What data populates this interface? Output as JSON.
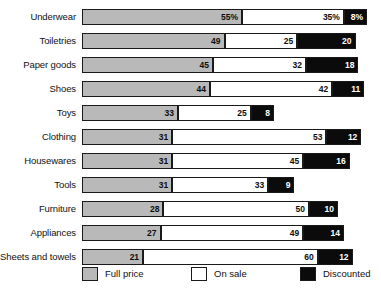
{
  "chart_data": {
    "type": "bar",
    "subtype": "stacked-horizontal",
    "title": "",
    "xlabel": "",
    "ylabel": "",
    "xlim": [
      0,
      100
    ],
    "grid": false,
    "legend_position": "bottom",
    "value_suffix_first_row": "%",
    "categories": [
      "Underwear",
      "Toiletries",
      "Paper goods",
      "Shoes",
      "Toys",
      "Clothing",
      "Housewares",
      "Tools",
      "Furniture",
      "Appliances",
      "Sheets and towels"
    ],
    "series": [
      {
        "name": "Full price",
        "color": "#b9b9b9",
        "values": [
          55,
          49,
          45,
          44,
          33,
          31,
          31,
          31,
          28,
          27,
          21
        ]
      },
      {
        "name": "On sale",
        "color": "#ffffff",
        "values": [
          35,
          25,
          32,
          42,
          25,
          53,
          45,
          33,
          50,
          49,
          60
        ]
      },
      {
        "name": "Discounted",
        "color": "#0b0b0b",
        "values": [
          8,
          20,
          18,
          11,
          8,
          12,
          16,
          9,
          10,
          14,
          12
        ]
      }
    ],
    "bar_labels": [
      [
        "55%",
        "35%",
        "8%"
      ],
      [
        "49",
        "25",
        "20"
      ],
      [
        "45",
        "32",
        "18"
      ],
      [
        "44",
        "42",
        "11"
      ],
      [
        "33",
        "25",
        "8"
      ],
      [
        "31",
        "53",
        "12"
      ],
      [
        "31",
        "45",
        "16"
      ],
      [
        "31",
        "33",
        "9"
      ],
      [
        "28",
        "50",
        "10"
      ],
      [
        "27",
        "49",
        "14"
      ],
      [
        "21",
        "60",
        "12"
      ]
    ]
  },
  "legend": {
    "items": [
      {
        "label": "Full price",
        "swatch": "full"
      },
      {
        "label": "On sale",
        "swatch": "sale"
      },
      {
        "label": "Discounted",
        "swatch": "disc"
      }
    ]
  },
  "colors": {
    "full_price": "#b9b9b9",
    "on_sale": "#ffffff",
    "discounted": "#0b0b0b",
    "outline": "#1a1a1a",
    "background": "#ffffff",
    "text": "#111111"
  }
}
